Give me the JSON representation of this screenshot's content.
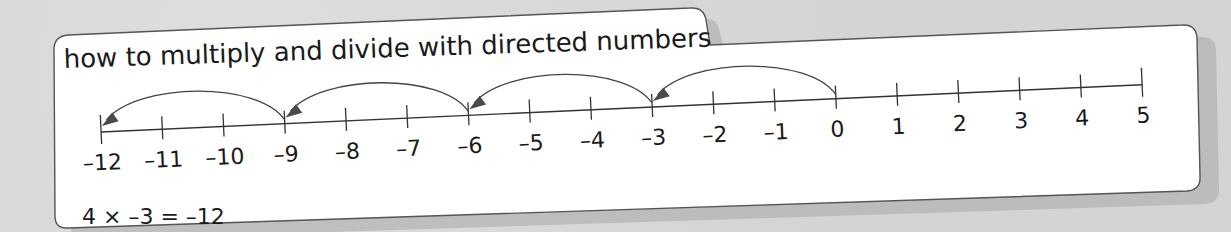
{
  "card": {
    "title": "how to multiply and divide with directed numbers",
    "equation": "4 × –3 = –12"
  },
  "number_line": {
    "ticks": [
      "–12",
      "–11",
      "–10",
      "–9",
      "–8",
      "–7",
      "–6",
      "–5",
      "–4",
      "–3",
      "–2",
      "–1",
      "0",
      "1",
      "2",
      "3",
      "4",
      "5"
    ],
    "min": -12,
    "max": 5,
    "jumps": [
      {
        "from": 0,
        "to": -3
      },
      {
        "from": -3,
        "to": -6
      },
      {
        "from": -6,
        "to": -9
      },
      {
        "from": -9,
        "to": -12
      }
    ],
    "jump_size": -3,
    "jump_count": 4
  },
  "colors": {
    "background": "#d6d6d6",
    "card": "#ffffff",
    "ink": "#1a1a1a",
    "arrow": "#4a4a4a",
    "shadow": "#9a9a9a"
  }
}
